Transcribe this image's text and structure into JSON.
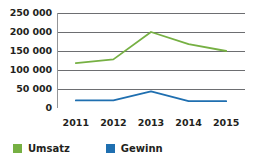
{
  "chart_data": {
    "type": "line",
    "title": "",
    "xlabel": "",
    "ylabel": "",
    "categories": [
      "2011",
      "2012",
      "2013",
      "2014",
      "2015"
    ],
    "series": [
      {
        "name": "Umsatz",
        "color": "#76b043",
        "values": [
          118000,
          128000,
          200000,
          168000,
          150000
        ]
      },
      {
        "name": "Gewinn",
        "color": "#1f6fb0",
        "values": [
          20000,
          20000,
          44000,
          18000,
          18000
        ]
      }
    ],
    "ylim": [
      0,
      250000
    ],
    "yticks": [
      0,
      50000,
      100000,
      150000,
      200000,
      250000
    ],
    "ytick_labels": [
      "0",
      "50 000",
      "100 000",
      "150 000",
      "200 000",
      "250 000"
    ],
    "grid": true,
    "grid_color": "#6d6e71",
    "axis_color": "#939598",
    "legend_position": "bottom-left"
  }
}
